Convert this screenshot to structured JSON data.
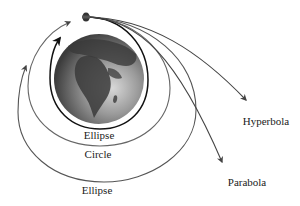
{
  "diagram": {
    "labels": {
      "inner_ellipse": "Ellipse",
      "circle": "Circle",
      "outer_ellipse": "Ellipse",
      "hyperbola": "Hyperbola",
      "parabola": "Parabola"
    },
    "colors": {
      "inner_ellipse": "#1a1a1a",
      "circle": "#666666",
      "outer_ellipse": "#555555",
      "hyperbola": "#444444",
      "parabola": "#444444",
      "earth_dark": "#3a3a3a",
      "earth_light": "#b8b8b8"
    }
  }
}
